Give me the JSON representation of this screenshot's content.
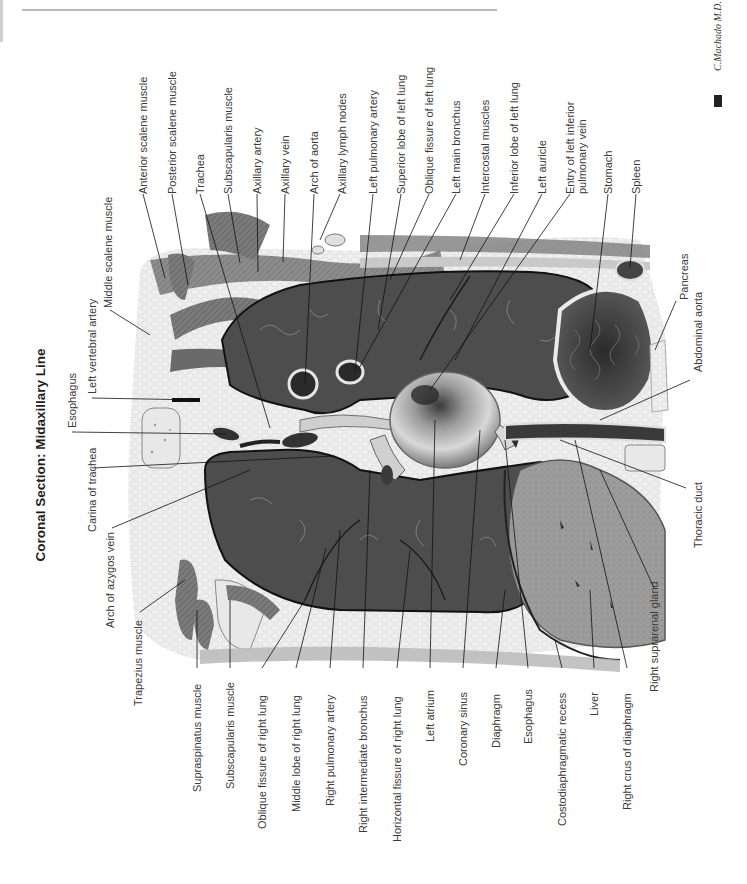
{
  "title": "Coronal Section: Midaxillary Line",
  "signature": {
    "artist": "C.Machado M.D.",
    "logo": "ICON"
  },
  "labels": {
    "top": [
      {
        "id": "anterior-scalene-muscle",
        "text": "Anterior scalene muscle"
      },
      {
        "id": "posterior-scalene-muscle",
        "text": "Posterior scalene muscle"
      },
      {
        "id": "trachea",
        "text": "Trachea"
      },
      {
        "id": "subscapularis-muscle-top",
        "text": "Subscapularis muscle"
      },
      {
        "id": "axillary-artery",
        "text": "Axillary artery"
      },
      {
        "id": "axillary-vein",
        "text": "Axillary vein"
      },
      {
        "id": "arch-of-aorta",
        "text": "Arch of aorta"
      },
      {
        "id": "axillary-lymph-nodes",
        "text": "Axillary lymph nodes"
      },
      {
        "id": "left-pulmonary-artery",
        "text": "Left pulmonary artery"
      },
      {
        "id": "superior-lobe-left-lung",
        "text": "Superior lobe of left lung"
      },
      {
        "id": "oblique-fissure-left-lung",
        "text": "Oblique fissure of left lung"
      },
      {
        "id": "left-main-bronchus",
        "text": "Left main bronchus"
      },
      {
        "id": "intercostal-muscles",
        "text": "Intercostal muscles"
      },
      {
        "id": "inferior-lobe-left-lung",
        "text": "Inferior lobe of left lung"
      },
      {
        "id": "left-auricle",
        "text": "Left auricle"
      },
      {
        "id": "entry-left-inferior-pulmonary-vein",
        "text": "Entry of left inferior\npulmonary vein"
      },
      {
        "id": "stomach",
        "text": "Stomach"
      },
      {
        "id": "spleen",
        "text": "Spleen"
      }
    ],
    "left": [
      {
        "id": "middle-scalene-muscle",
        "text": "Middle scalene muscle"
      },
      {
        "id": "left-vertebral-artery",
        "text": "Left vertebral artery"
      },
      {
        "id": "esophagus-left",
        "text": "Esophagus"
      },
      {
        "id": "carina-of-trachea",
        "text": "Carina of trachea"
      },
      {
        "id": "arch-of-azygos-vein",
        "text": "Arch of azygos vein"
      },
      {
        "id": "trapezius-muscle",
        "text": "Trapezius muscle"
      }
    ],
    "bottom": [
      {
        "id": "supraspinatus-muscle",
        "text": "Supraspinatus muscle"
      },
      {
        "id": "subscapularis-muscle-bottom",
        "text": "Subscapularis muscle"
      },
      {
        "id": "oblique-fissure-right-lung",
        "text": "Oblique fissure of right lung"
      },
      {
        "id": "middle-lobe-right-lung",
        "text": "Middle lobe of right lung"
      },
      {
        "id": "right-pulmonary-artery",
        "text": "Right pulmonary artery"
      },
      {
        "id": "right-intermediate-bronchus",
        "text": "Right intermediate bronchus"
      },
      {
        "id": "horizontal-fissure-right-lung",
        "text": "Horizontal fissure of right lung"
      },
      {
        "id": "left-atrium",
        "text": "Left atrium"
      },
      {
        "id": "coronary-sinus",
        "text": "Coronary sinus"
      },
      {
        "id": "diaphragm",
        "text": "Diaphragm"
      },
      {
        "id": "esophagus-bottom",
        "text": "Esophagus"
      },
      {
        "id": "costodiaphragmatic-recess",
        "text": "Costodiaphragmatic recess"
      },
      {
        "id": "liver",
        "text": "Liver"
      },
      {
        "id": "right-crus-of-diaphragm",
        "text": "Right crus of diaphragm"
      },
      {
        "id": "right-suprarenal-gland",
        "text": "Right suprarenal gland"
      }
    ],
    "right": [
      {
        "id": "pancreas",
        "text": "Pancreas"
      },
      {
        "id": "abdominal-aorta",
        "text": "Abdominal aorta"
      },
      {
        "id": "thoracic-duct",
        "text": "Thoracic duct"
      }
    ]
  }
}
